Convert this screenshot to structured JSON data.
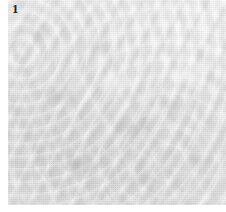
{
  "figure": {
    "label": "1",
    "label_position": {
      "x": 12,
      "y": 2
    },
    "label_color": "#231f20",
    "panel": {
      "width": 226,
      "height": 212,
      "background": "#ffffff"
    },
    "image": {
      "name": "grayscale-micrograph",
      "description": "Low-contrast grayscale textured surface micrograph with fine granular relief",
      "left": 8,
      "top": 0,
      "width": 218,
      "height": 205,
      "base_color": "#e6e6e6",
      "highlight_color": "#f2f2f2",
      "shadow_color": "#c8c8c8",
      "texture": "granular-relief",
      "tone_notes": {
        "upper_right": "lighter and smoother",
        "lower_left": "darker and more granular",
        "center": "moderate mottled relief"
      }
    },
    "margins": {
      "left": 8,
      "top": 0,
      "right": 0,
      "bottom": 7
    }
  }
}
